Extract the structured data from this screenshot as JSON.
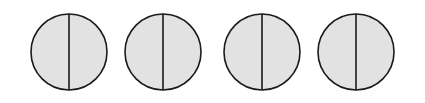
{
  "diagram": {
    "shape_count": 4,
    "shapes": [
      {
        "type": "circle",
        "parts": 2,
        "divider": "vertical"
      },
      {
        "type": "circle",
        "parts": 2,
        "divider": "vertical"
      },
      {
        "type": "circle",
        "parts": 2,
        "divider": "vertical"
      },
      {
        "type": "circle",
        "parts": 2,
        "divider": "vertical"
      }
    ],
    "colors": {
      "fill": "#e2e2e2",
      "stroke": "#1a1a1a",
      "background": "#ffffff"
    }
  }
}
